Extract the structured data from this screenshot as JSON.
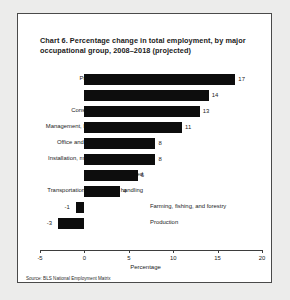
{
  "figure": {
    "title": "Chart 6. Percentage change in total employment, by major occupational group, 2008–2018 (projected)",
    "source": "Source: BLS National Employment Matrix",
    "bar_color": "#0d0d0d",
    "panel_background": "#ffffff",
    "page_background": "#ececeb"
  },
  "chart_data": {
    "type": "bar",
    "orientation": "horizontal",
    "title": "Chart 6. Percentage change in total employment, by major occupational group, 2008–2018 (projected)",
    "xlabel": "Percentage",
    "ylabel": "",
    "xlim": [
      -5,
      20
    ],
    "xticks": [
      -5,
      0,
      5,
      10,
      15,
      20
    ],
    "xtick_labels": [
      "-5",
      "0",
      "5",
      "10",
      "15",
      "20"
    ],
    "grid": false,
    "legend": false,
    "categories": [
      "Professional and related",
      "Service",
      "Construction and extraction",
      "Management, business, and financial",
      "Office and administrative support",
      "Installation, maintenance, and repair",
      "Sales and related",
      "Transportation and material handling",
      "Farming, fishing, and forestry",
      "Production"
    ],
    "values": [
      17,
      14,
      13,
      11,
      8,
      8,
      6,
      4,
      -1,
      -3
    ],
    "value_labels": [
      "17",
      "14",
      "13",
      "11",
      "8",
      "8",
      "6",
      "4",
      "-1",
      "-3"
    ],
    "source": "Source: BLS National Employment Matrix"
  }
}
